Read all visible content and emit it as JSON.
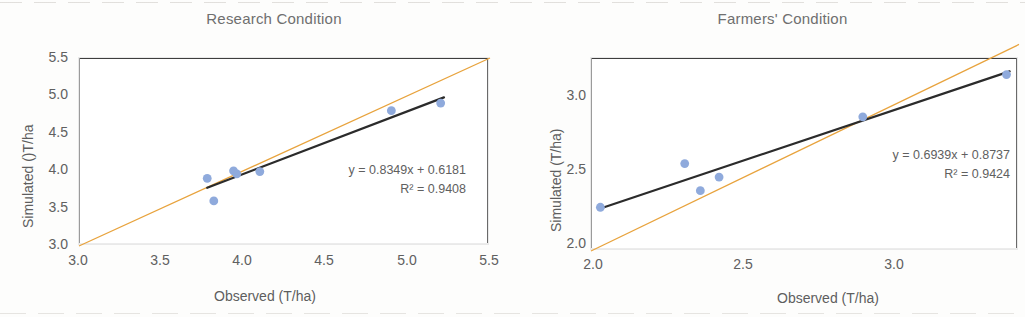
{
  "figure": {
    "background": "#ffffff",
    "marker_color": "#8FAADC",
    "fit_line_color": "#2b2b2b",
    "identity_line_color": "#E8A33D"
  },
  "panels": [
    {
      "id": "research",
      "title": "Research Condition",
      "xlabel": "Observed (T/ha)",
      "ylabel": "Simulated ()T/ha",
      "equation": "y = 0.8349x + 0.6181",
      "r2": "R² = 0.9408",
      "xticks": [
        "3.0",
        "3.5",
        "4.0",
        "4.5",
        "5.0",
        "5.5"
      ],
      "yticks": [
        "5.5",
        "5.0",
        "4.5",
        "4.0",
        "3.5",
        "3.0"
      ]
    },
    {
      "id": "farmers",
      "title": "Farmers' Condition",
      "xlabel": "Observed (T/ha)",
      "ylabel": "Simulated (T/ha)",
      "equation": "y = 0.6939x + 0.8737",
      "r2": "R² = 0.9424",
      "xticks": [
        "2.0",
        "2.5",
        "3.0"
      ],
      "yticks": [
        "3.0",
        "2.5",
        "2.0"
      ]
    }
  ],
  "chart_data": [
    {
      "type": "scatter",
      "title": "Research Condition",
      "xlabel": "Observed (T/ha)",
      "ylabel": "Simulated ()T/ha",
      "xlim": [
        3.0,
        5.5
      ],
      "ylim": [
        3.0,
        5.5
      ],
      "xticks": [
        3.0,
        3.5,
        4.0,
        4.5,
        5.0,
        5.5
      ],
      "yticks": [
        3.0,
        3.5,
        4.0,
        4.5,
        5.0,
        5.5
      ],
      "grid": false,
      "legend": "none",
      "series": [
        {
          "name": "Observed vs Simulated",
          "marker_color": "#8FAADC",
          "x": [
            3.78,
            3.82,
            3.94,
            3.96,
            4.1,
            4.9,
            5.2
          ],
          "y": [
            3.9,
            3.6,
            4.0,
            3.96,
            3.99,
            4.8,
            4.9
          ]
        }
      ],
      "trendline": {
        "type": "linear",
        "equation": "y = 0.8349x + 0.6181",
        "slope": 0.8349,
        "intercept": 0.6181,
        "r2": 0.9408,
        "r2_label": "R² = 0.9408",
        "color": "#2b2b2b",
        "x_from": 3.78,
        "x_to": 5.22
      },
      "identity_line": {
        "label": "1:1 line",
        "color": "#E8A33D",
        "x_from": 3.0,
        "x_to": 5.5
      },
      "annotations": [
        "y = 0.8349x + 0.6181",
        "R² = 0.9408"
      ]
    },
    {
      "type": "scatter",
      "title": "Farmers' Condition",
      "xlabel": "Observed (T/ha)",
      "ylabel": "Simulated (T/ha)",
      "xlim": [
        2.0,
        3.37
      ],
      "ylim": [
        2.0,
        3.28
      ],
      "xticks": [
        2.0,
        2.5,
        3.0
      ],
      "yticks": [
        2.0,
        2.5,
        3.0
      ],
      "grid": false,
      "legend": "none",
      "series": [
        {
          "name": "Observed vs Simulated",
          "marker_color": "#8FAADC",
          "x": [
            2.03,
            2.3,
            2.35,
            2.41,
            2.87,
            3.33
          ],
          "y": [
            2.29,
            2.58,
            2.4,
            2.49,
            2.89,
            3.17
          ]
        }
      ],
      "trendline": {
        "type": "linear",
        "equation": "y = 0.6939x + 0.8737",
        "slope": 0.6939,
        "intercept": 0.8737,
        "r2": 0.9424,
        "r2_label": "R² = 0.9424",
        "color": "#2b2b2b",
        "x_from": 2.03,
        "x_to": 3.34
      },
      "identity_line": {
        "label": "1:1 line",
        "color": "#E8A33D",
        "x_from": 2.0,
        "x_to": 3.37
      },
      "annotations": [
        "y = 0.6939x + 0.8737",
        "R² = 0.9424"
      ]
    }
  ]
}
